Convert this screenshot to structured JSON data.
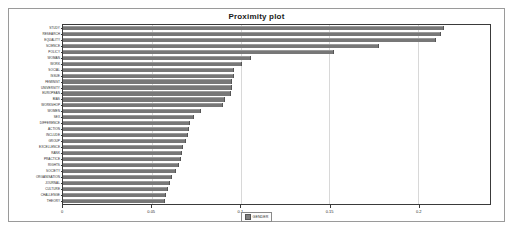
{
  "panel": {
    "title": "Proximity plot"
  },
  "legend": {
    "label": "GENDER",
    "swatch_color": "#7e7e7e"
  },
  "axis": {
    "xlabel": "",
    "ylabel": "",
    "ticks": [
      "0",
      "0.05",
      "0.1",
      "0.15",
      "0.2"
    ],
    "tick_values": [
      0,
      0.05,
      0.1,
      0.15,
      0.2
    ]
  },
  "colors": {
    "bar": "#7e7e7e",
    "bar_edge": "#555555",
    "frame": "#3a3a3a",
    "panel_border": "#9a9a9a",
    "gridline": "#d8d8d8",
    "background": "#ffffff",
    "text": "#2a2a2a"
  },
  "chart_data": {
    "type": "bar",
    "orientation": "horizontal",
    "title": "Proximity plot",
    "xlabel": "",
    "ylabel": "",
    "xlim": [
      0,
      0.2405
    ],
    "grid": true,
    "legend": [
      "GENDER"
    ],
    "legend_position": "bottom-center",
    "categories": [
      "STUDY",
      "RESEARCH",
      "EQUALITY",
      "SCIENCE",
      "POLICY",
      "WOMAN",
      "WORK",
      "SOCIAL",
      "ISSUE",
      "FEMINIST",
      "UNIVERSITY",
      "EUROPEAN",
      "BIAS",
      "WORKSHOP",
      "WOMEN",
      "SEX",
      "DIFFERENCE",
      "ACTION",
      "INCLUDE",
      "GROUP",
      "EXCELLENCE",
      "RANK",
      "PRACTICE",
      "RIGHTS",
      "SOCIETY",
      "ORGANISATION",
      "JOURNAL",
      "CULTURE",
      "CHALLENGE",
      "THEORY"
    ],
    "values": [
      0.2142,
      0.2122,
      0.2097,
      0.1773,
      0.152,
      0.1051,
      0.1,
      0.096,
      0.0955,
      0.0949,
      0.0944,
      0.0939,
      0.0904,
      0.0894,
      0.0773,
      0.0732,
      0.0712,
      0.0702,
      0.0697,
      0.0687,
      0.0672,
      0.0667,
      0.0657,
      0.0646,
      0.0631,
      0.0606,
      0.0596,
      0.0586,
      0.0576,
      0.0571
    ]
  }
}
